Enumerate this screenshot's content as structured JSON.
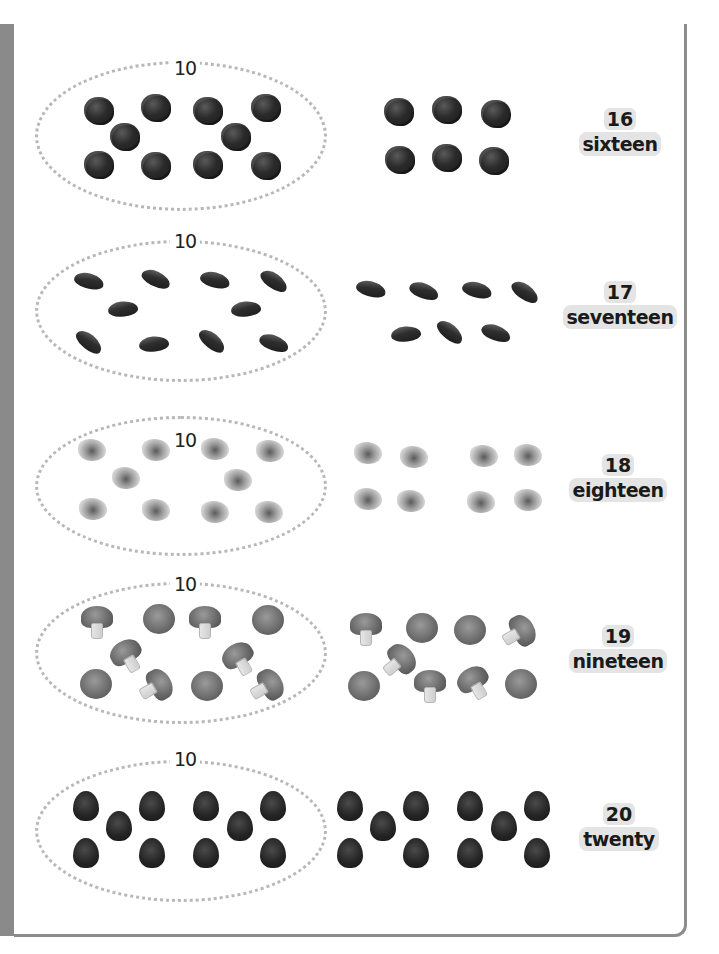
{
  "page": {
    "colors": {
      "left_strip": "#8a8a8a",
      "frame_border": "#8c8c8c",
      "ellipse_dots": "#b8b8b8",
      "label_bg": "#e4e4e4",
      "text": "#1a1a1a"
    }
  },
  "rows": [
    {
      "group_label": "10",
      "item": "blackberry-icon",
      "grouped_count": 10,
      "extra_count": 6,
      "number": "16",
      "word": "sixteen"
    },
    {
      "group_label": "10",
      "item": "kidney-bean-icon",
      "grouped_count": 10,
      "extra_count": 7,
      "number": "17",
      "word": "seventeen"
    },
    {
      "group_label": "10",
      "item": "walnut-icon",
      "grouped_count": 10,
      "extra_count": 8,
      "number": "18",
      "word": "eighteen"
    },
    {
      "group_label": "10",
      "item": "mushroom-icon",
      "grouped_count": 10,
      "extra_count": 9,
      "number": "19",
      "word": "nineteen"
    },
    {
      "group_label": "10",
      "item": "raspberry-icon",
      "grouped_count": 10,
      "extra_count": 10,
      "number": "20",
      "word": "twenty"
    }
  ]
}
